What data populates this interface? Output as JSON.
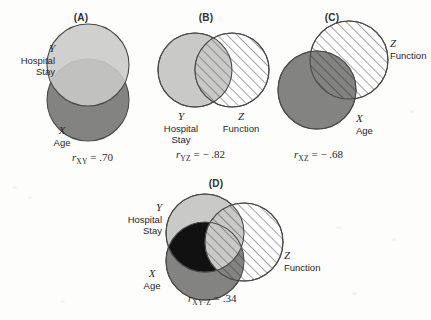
{
  "figure": {
    "background_color": "#fdfdfc",
    "fill_light_gray": "#c9c9c7",
    "fill_dark_gray": "#838382",
    "fill_black": "#111111",
    "fill_hatch_white": "#ffffff",
    "stroke_color": "#4a4a4a",
    "hatch_color": "#5a5a5a"
  },
  "panels": [
    {
      "id": "A",
      "label": "(A)",
      "variables": [
        {
          "symbol": "Y",
          "name": "Hospital Stay",
          "fill": "light-gray"
        },
        {
          "symbol": "X",
          "name": "Age",
          "fill": "dark-gray"
        }
      ],
      "stat": {
        "r": "r",
        "subscript": "XY",
        "operator": "=",
        "value": ".70",
        "text": "r XY = .70"
      }
    },
    {
      "id": "B",
      "label": "(B)",
      "variables": [
        {
          "symbol": "Y",
          "name": "Hospital Stay",
          "fill": "light-gray"
        },
        {
          "symbol": "Z",
          "name": "Function",
          "fill": "hatched"
        }
      ],
      "stat": {
        "r": "r",
        "subscript": "YZ",
        "operator": "=",
        "value": "− .82",
        "text": "r YZ = − .82"
      }
    },
    {
      "id": "C",
      "label": "(C)",
      "variables": [
        {
          "symbol": "Z",
          "name": "Function",
          "fill": "hatched"
        },
        {
          "symbol": "X",
          "name": "Age",
          "fill": "dark-gray"
        }
      ],
      "stat": {
        "r": "r",
        "subscript": "XZ",
        "operator": "=",
        "value": "− .68",
        "text": "r XZ = − .68"
      }
    },
    {
      "id": "D",
      "label": "(D)",
      "variables": [
        {
          "symbol": "Y",
          "name": "Hospital Stay",
          "fill": "light-gray"
        },
        {
          "symbol": "X",
          "name": "Age",
          "fill": "dark-gray"
        },
        {
          "symbol": "Z",
          "name": "Function",
          "fill": "hatched"
        }
      ],
      "stat": {
        "r": "r",
        "subscript": "XY·Z",
        "operator": "=",
        "value": ".34",
        "text": "r XY·Z = .34"
      }
    }
  ],
  "labels": {
    "panel_a": "(A)",
    "panel_b": "(B)",
    "panel_c": "(C)",
    "panel_d": "(D)",
    "y_symbol": "Y",
    "x_symbol": "X",
    "z_symbol": "Z",
    "hospital_line1": "Hospital",
    "hospital_line2": "Stay",
    "age": "Age",
    "function": "Function"
  },
  "stats_text": {
    "a": ".70",
    "b": "− .82",
    "c": "− .68",
    "d": ".34",
    "a_sub": "XY",
    "b_sub": "YZ",
    "c_sub": "XZ",
    "d_sub": "XY·Z",
    "r_glyph": "r",
    "eq": "="
  }
}
